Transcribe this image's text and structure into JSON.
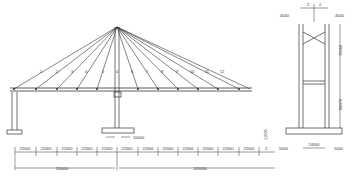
{
  "diagram": {
    "colors": {
      "line": "#333333",
      "background": "#ffffff"
    },
    "elevation": {
      "cable_labels": [
        "1",
        "2",
        "3",
        "4",
        "5",
        "0",
        "6",
        "7",
        "8",
        "9",
        "10",
        "11",
        "12"
      ],
      "tower_base_dim": "10000",
      "segment_dims": [
        "22000",
        "22000",
        "22000",
        "22000",
        "22000",
        "22000",
        "22000",
        "22000",
        "22000",
        "22000",
        "22000",
        "22000",
        "2"
      ],
      "span_left": "110000",
      "span_right": "165000",
      "left_pier_dim": "15000",
      "right_end_dim": "11000"
    },
    "cross_section": {
      "top_offsets": [
        "2",
        "2"
      ],
      "left_width": "4000",
      "right_width": "4000",
      "upper_height": "70000",
      "lower_height": "28476",
      "base_width": "24000",
      "left_footing": "5000",
      "right_footing": "5000"
    }
  }
}
